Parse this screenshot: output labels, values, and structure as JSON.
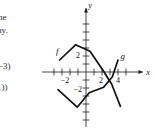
{
  "gutter": {
    "lines": [
      "he",
      "hy.",
      ")",
      "(−3)",
      "1))"
    ]
  },
  "figure": {
    "x_axis_label": "x",
    "y_axis_label": "y",
    "curve_labels": {
      "f": "f",
      "g": "g"
    }
  },
  "chart_data": {
    "type": "line",
    "title": "",
    "xlabel": "x",
    "ylabel": "y",
    "xlim": [
      -4.2,
      5.6
    ],
    "ylim": [
      -5.2,
      4.6
    ],
    "grid": false,
    "legend": "inline-curve-labels",
    "x_ticks": [
      -4,
      -3,
      -2,
      -1,
      1,
      2,
      3,
      4,
      5
    ],
    "y_ticks": [
      -4,
      -3,
      -2,
      -1,
      1,
      2,
      3,
      4
    ],
    "x_tick_labels": [
      {
        "value": -2,
        "text": "−2"
      },
      {
        "value": 2,
        "text": "2"
      },
      {
        "value": 4,
        "text": "4"
      }
    ],
    "y_tick_labels": [
      {
        "value": 2,
        "text": "2"
      },
      {
        "value": -2,
        "text": "−2"
      }
    ],
    "series": [
      {
        "name": "f",
        "label": "f",
        "label_point": [
          -3.6,
          2.3
        ],
        "points": [
          [
            -3.3,
            1.5
          ],
          [
            -1.3,
            3.4
          ],
          [
            0.5,
            2.6
          ],
          [
            2.2,
            0.1
          ],
          [
            3.2,
            -1.5
          ],
          [
            4.3,
            -4.3
          ]
        ]
      },
      {
        "name": "g",
        "label": "g",
        "label_point": [
          4.6,
          1.6
        ],
        "points": [
          [
            -3.5,
            -2.2
          ],
          [
            -1.1,
            -4.4
          ],
          [
            0.4,
            -2.6
          ],
          [
            2.2,
            -1.9
          ],
          [
            3.3,
            -0.6
          ],
          [
            4.0,
            1.5
          ]
        ]
      }
    ],
    "intersections": [
      [
        3.0,
        -0.9
      ]
    ]
  }
}
